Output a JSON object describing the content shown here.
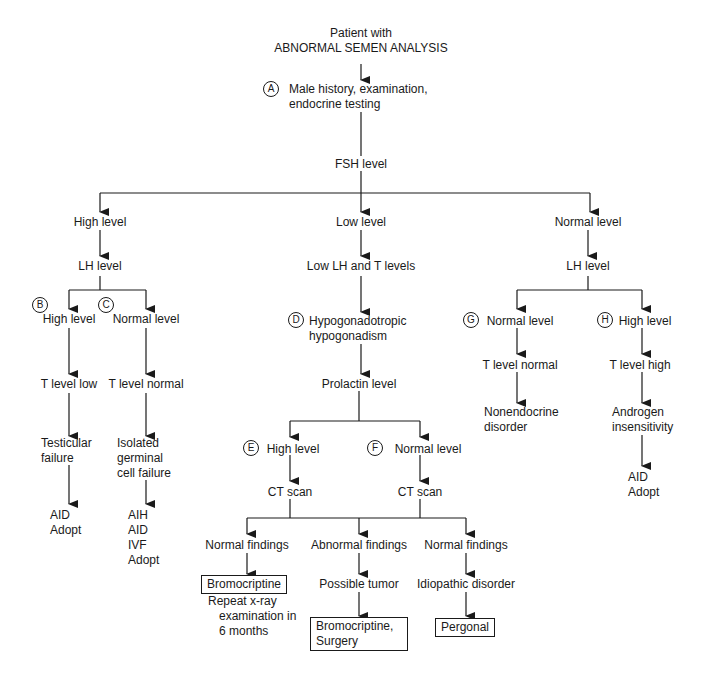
{
  "diagram": {
    "title_line1": "Patient with",
    "title_line2": "ABNORMAL SEMEN ANALYSIS",
    "step_a": {
      "badge": "A",
      "line1": "Male history, examination,",
      "line2": "endocrine testing"
    },
    "fsh": "FSH level",
    "branches": {
      "high": {
        "label": "High level",
        "lh": "LH level",
        "b": {
          "badge": "B",
          "label": "High level",
          "t": "T level low",
          "dx_line1": "Testicular",
          "dx_line2": "failure",
          "tx": [
            "AID",
            "Adopt"
          ]
        },
        "c": {
          "badge": "C",
          "label": "Normal level",
          "t": "T level normal",
          "dx_line1": "Isolated",
          "dx_line2": "germinal",
          "dx_line3": "cell failure",
          "tx": [
            "AIH",
            "AID",
            "IVF",
            "Adopt"
          ]
        }
      },
      "low": {
        "label": "Low level",
        "lh_t": "Low LH and T levels",
        "d": {
          "badge": "D",
          "line1": "Hypogonadotropic",
          "line2": "hypogonadism"
        },
        "prolactin": "Prolactin level",
        "e": {
          "badge": "E",
          "label": "High level",
          "ct": "CT scan"
        },
        "f": {
          "badge": "F",
          "label": "Normal level",
          "ct": "CT scan"
        },
        "outcomes": [
          {
            "finding": "Normal findings",
            "box": "Bromocriptine",
            "note_line1": "Repeat x-ray",
            "note_line2": "examination in",
            "note_line3": "6 months"
          },
          {
            "finding": "Abnormal findings",
            "next": "Possible tumor",
            "box_line1": "Bromocriptine,",
            "box_line2": "Surgery"
          },
          {
            "finding": "Normal findings",
            "next": "Idiopathic disorder",
            "box": "Pergonal"
          }
        ]
      },
      "normal": {
        "label": "Normal level",
        "lh": "LH level",
        "g": {
          "badge": "G",
          "label": "Normal level",
          "t": "T level normal",
          "dx_line1": "Nonendocrine",
          "dx_line2": "disorder"
        },
        "h": {
          "badge": "H",
          "label": "High level",
          "t": "T level high",
          "dx_line1": "Androgen",
          "dx_line2": "insensitivity",
          "tx": [
            "AID",
            "Adopt"
          ]
        }
      }
    }
  }
}
